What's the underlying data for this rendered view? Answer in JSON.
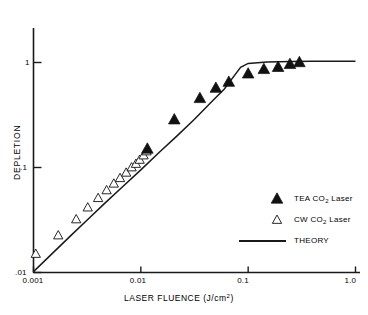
{
  "chart_data": {
    "type": "scatter",
    "title": "",
    "xlabel": "LASER FLUENCE (J/cm²)",
    "ylabel": "DEPLETION",
    "xscale": "log",
    "yscale": "log",
    "xlim": [
      0.001,
      1.0
    ],
    "ylim": [
      0.01,
      1.0
    ],
    "grid": false,
    "xticks": [
      0.001,
      0.01,
      0.1,
      1.0
    ],
    "xticklabels": [
      "0.001",
      "0.01",
      "0.1",
      "1.0"
    ],
    "yticks": [
      0.01,
      0.1,
      1.0
    ],
    "yticklabels": [
      ".01",
      ".1",
      "1"
    ],
    "legend_position": "right-middle",
    "series": [
      {
        "name": "TEA CO2 Laser",
        "label_html": "TEA CO<sub>2</sub> Laser",
        "marker": "filled-triangle",
        "color": "#000000",
        "x": [
          0.0115,
          0.0205,
          0.0355,
          0.05,
          0.066,
          0.1,
          0.14,
          0.19,
          0.245,
          0.3
        ],
        "y": [
          0.15,
          0.285,
          0.455,
          0.57,
          0.65,
          0.78,
          0.86,
          0.9,
          0.96,
          1.0
        ]
      },
      {
        "name": "CW CO2 Laser",
        "label_html": "CW CO<sub>2</sub> Laser",
        "marker": "open-triangle",
        "color": "#000000",
        "x": [
          0.00105,
          0.0017,
          0.0025,
          0.0032,
          0.004,
          0.0048,
          0.0056,
          0.0064,
          0.0073,
          0.0082,
          0.009,
          0.00975,
          0.0106,
          0.0113
        ],
        "y": [
          0.015,
          0.0225,
          0.032,
          0.0415,
          0.051,
          0.0605,
          0.07,
          0.079,
          0.089,
          0.1,
          0.108,
          0.118,
          0.13,
          0.142
        ]
      },
      {
        "name": "THEORY",
        "label_html": "THEORY",
        "marker": "line",
        "color": "#000000",
        "x": [
          0.001,
          0.0015,
          0.0022,
          0.0032,
          0.0046,
          0.0068,
          0.01,
          0.0147,
          0.0215,
          0.0316,
          0.0464,
          0.06,
          0.07,
          0.085,
          0.1,
          0.15,
          0.25,
          0.4,
          0.7,
          1.0
        ],
        "y": [
          0.0102,
          0.0152,
          0.0222,
          0.032,
          0.0455,
          0.066,
          0.095,
          0.138,
          0.198,
          0.288,
          0.43,
          0.56,
          0.69,
          0.9,
          0.98,
          1.01,
          1.02,
          1.025,
          1.028,
          1.03
        ]
      }
    ]
  },
  "axis": {
    "x_title": "LASER FLUENCE (J/cm",
    "x_title_tail": ")",
    "x_unit_sup": "2",
    "y_title": "DEPLETION"
  },
  "ticks": {
    "x": [
      {
        "label": "0.001"
      },
      {
        "label": "0.01"
      },
      {
        "label": "0.1"
      },
      {
        "label": "1.0"
      }
    ],
    "y": [
      {
        "label": "1"
      },
      {
        "label": ".1"
      },
      {
        "label": ".01"
      }
    ]
  },
  "legend": {
    "items": [
      {
        "marker": "filled-triangle",
        "prefix": "TEA CO",
        "sub": "2",
        "suffix": " Laser"
      },
      {
        "marker": "open-triangle",
        "prefix": "CW CO",
        "sub": "2",
        "suffix": " Laser"
      },
      {
        "marker": "line",
        "prefix": "THEORY",
        "sub": "",
        "suffix": ""
      }
    ]
  },
  "colors": {
    "axis": "#1a1a1a",
    "curve": "#1a1a1a",
    "marker_fill": "#111111",
    "background": "#ffffff"
  }
}
